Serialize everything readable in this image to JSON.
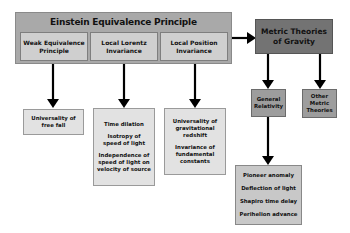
{
  "diagram": {
    "principle": {
      "title": "Einstein Equivalence Principle",
      "components": [
        {
          "label": "Weak Equivalence Principle"
        },
        {
          "label": "Local Lorentz Invariance"
        },
        {
          "label": "Local Position Invariance"
        }
      ]
    },
    "consequences": [
      {
        "items": [
          "Universality of free fall"
        ]
      },
      {
        "items": [
          "Time dilation",
          "Isotropy of speed of light",
          "Independence of speed of light on velocity of source"
        ]
      },
      {
        "items": [
          "Universality of gravitational redshift",
          "Invariance of fundamental constants"
        ]
      }
    ],
    "metric": {
      "label": "Metric Theories of Gravity"
    },
    "theories": [
      {
        "label": "General Relativity"
      },
      {
        "label": "Other Metric Theories"
      }
    ],
    "tests": {
      "items": [
        "Pioneer anomaly",
        "Deflection of light",
        "Shapiro time delay",
        "Perihelion advance"
      ]
    },
    "colors": {
      "outer": "#a9a9a9",
      "inner": "#cfcfcf",
      "metric": "#737373",
      "theory": "#9d9d9d",
      "arrow": "#000000"
    }
  }
}
